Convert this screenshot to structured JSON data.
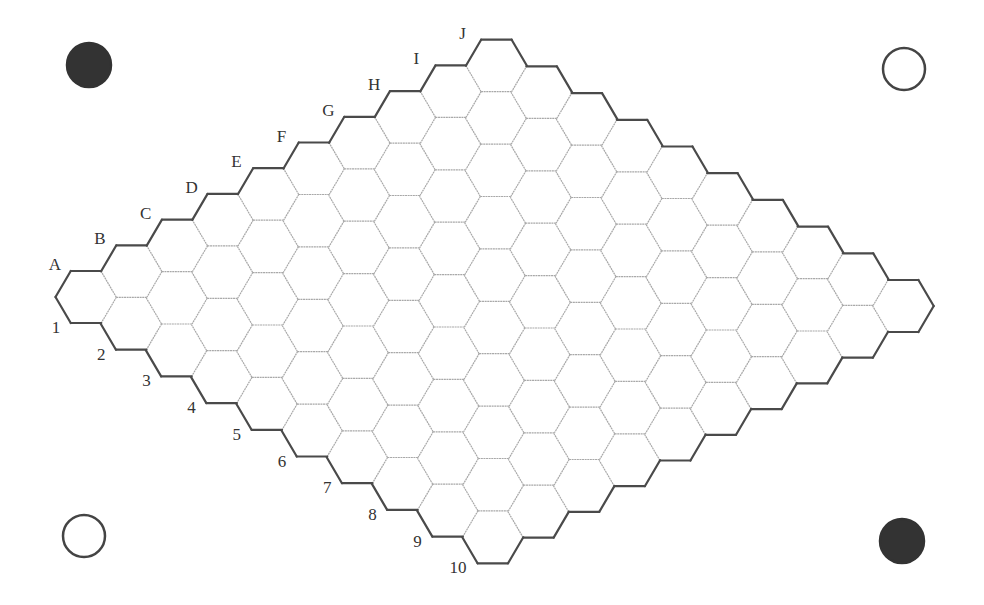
{
  "board": {
    "type": "hex",
    "size": 10,
    "letters": [
      "A",
      "B",
      "C",
      "D",
      "E",
      "F",
      "G",
      "H",
      "I",
      "J"
    ],
    "numbers": [
      "1",
      "2",
      "3",
      "4",
      "5",
      "6",
      "7",
      "8",
      "9",
      "10"
    ],
    "cells_occupied": [],
    "geometry": {
      "origin_a1": [
        86,
        297
      ],
      "letter_step": [
        45.6,
        -25.7
      ],
      "number_step": [
        45.2,
        26.7
      ],
      "hex_radius": 30.5,
      "hex_half_height": 26
    }
  },
  "corner_markers": [
    {
      "position": "top-left",
      "color": "black",
      "cx": 89,
      "cy": 65,
      "r": 22
    },
    {
      "position": "top-right",
      "color": "white",
      "cx": 904,
      "cy": 69,
      "r": 21
    },
    {
      "position": "bottom-left",
      "color": "white",
      "cx": 84,
      "cy": 536,
      "r": 21
    },
    {
      "position": "bottom-right",
      "color": "black",
      "cx": 902,
      "cy": 541,
      "r": 22
    }
  ],
  "colors": {
    "background": "#ffffff",
    "black_stone": "#333333",
    "white_stone_fill": "#ffffff",
    "white_stone_stroke": "#444444",
    "outer_edge": "#4a4a4a",
    "inner_edge": "#a8a8a8",
    "label": "#333333"
  }
}
